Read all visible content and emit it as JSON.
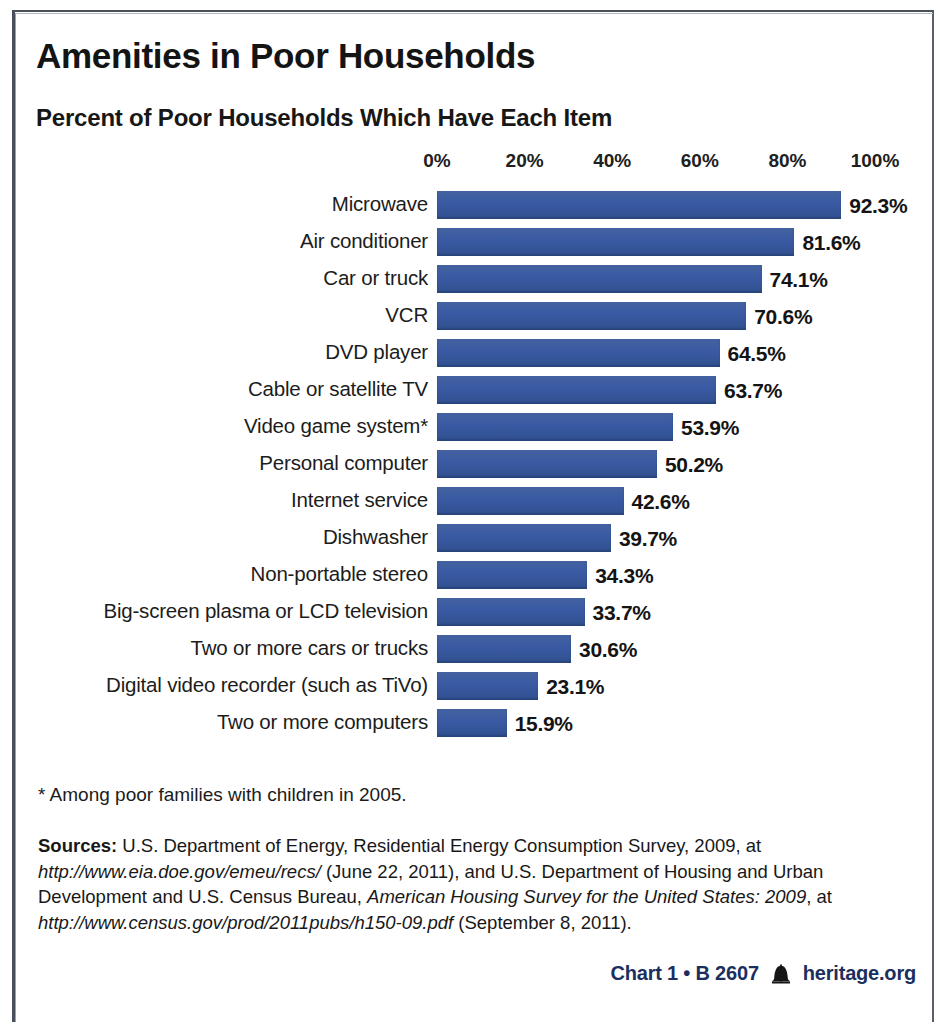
{
  "title": "Amenities in Poor Households",
  "subtitle": "Percent of Poor Households Which Have Each Item",
  "footnote": "* Among poor families with children in 2005.",
  "sources": {
    "label": "Sources:",
    "line1": " U.S. Department of Energy, Residential Energy Consumption Survey, 2009, at ",
    "url1": "http://www.eia.doe.gov/emeu/recs/",
    "line2": " (June 22, 2011), and U.S. Department of Housing and Urban Development and U.S. Census Bureau, ",
    "italic_title": "American Housing Survey for the United States: 2009",
    "line3": ", at ",
    "url2": "http://www.census.gov/prod/2011pubs/h150-09.pdf",
    "line4": " (September 8, 2011)."
  },
  "footer": {
    "chart_id": "Chart 1 • B 2607",
    "bell_icon": "liberty-bell-icon",
    "site": "heritage.org"
  },
  "colors": {
    "bar": "#3a5ba4",
    "footer_text": "#1b2f5e",
    "text": "#1b1b1b"
  },
  "chart_data": {
    "type": "bar",
    "orientation": "horizontal",
    "title": "Amenities in Poor Households",
    "subtitle": "Percent of Poor Households Which Have Each Item",
    "xlabel": "",
    "ylabel": "",
    "xlim": [
      0,
      100
    ],
    "grid": false,
    "legend": "none",
    "tick_labels": [
      "0%",
      "20%",
      "40%",
      "60%",
      "80%",
      "100%"
    ],
    "ticks": [
      0,
      20,
      40,
      60,
      80,
      100
    ],
    "categories": [
      "Microwave",
      "Air conditioner",
      "Car or truck",
      "VCR",
      "DVD player",
      "Cable or satellite TV",
      "Video game system*",
      "Personal computer",
      "Internet service",
      "Dishwasher",
      "Non-portable stereo",
      "Big-screen plasma or LCD television",
      "Two or more cars or trucks",
      "Digital video recorder (such as TiVo)",
      "Two or more computers"
    ],
    "values": [
      92.3,
      81.6,
      74.1,
      70.6,
      64.5,
      63.7,
      53.9,
      50.2,
      42.6,
      39.7,
      34.3,
      33.7,
      30.6,
      23.1,
      15.9
    ],
    "value_labels": [
      "92.3%",
      "81.6%",
      "74.1%",
      "70.6%",
      "64.5%",
      "63.7%",
      "53.9%",
      "50.2%",
      "42.6%",
      "39.7%",
      "34.3%",
      "33.7%",
      "30.6%",
      "23.1%",
      "15.9%"
    ]
  }
}
